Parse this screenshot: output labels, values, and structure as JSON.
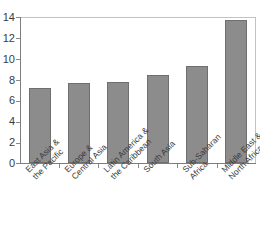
{
  "chart_data": {
    "type": "bar",
    "title": "",
    "xlabel": "",
    "ylabel": "",
    "categories": [
      "East Asia & the Pacific",
      "Europe & Central Asia",
      "Latin America & the Caribbean",
      "South Asia",
      "Sub-Saharan Africa",
      "Middle East & North Africa"
    ],
    "category_lines": [
      [
        "East Asia &",
        "the Pacific"
      ],
      [
        "Europe &",
        "Central Asia"
      ],
      [
        "Latin America &",
        "the Caribbean"
      ],
      [
        "South Asia",
        ""
      ],
      [
        "Sub-Saharan",
        "Africa"
      ],
      [
        "Middle East &",
        "North Africa"
      ]
    ],
    "values": [
      7.2,
      7.7,
      7.8,
      8.4,
      9.3,
      13.7
    ],
    "ylim": [
      0,
      14
    ],
    "ytick_labels": [
      "14",
      "12",
      "10",
      "8",
      "6",
      "4",
      "2",
      "0"
    ],
    "ytick_values": [
      14,
      12,
      10,
      8,
      6,
      4,
      2,
      0
    ],
    "grid": false,
    "legend": false,
    "bar_color": "#8c8c8c",
    "bar_border_color": "#6f6f6f",
    "axis_color": "#7d7d7d",
    "frame_color": "#c2c2c2",
    "text_color": "#3c3c3c",
    "background": "#ffffff"
  },
  "clipped_title": ""
}
